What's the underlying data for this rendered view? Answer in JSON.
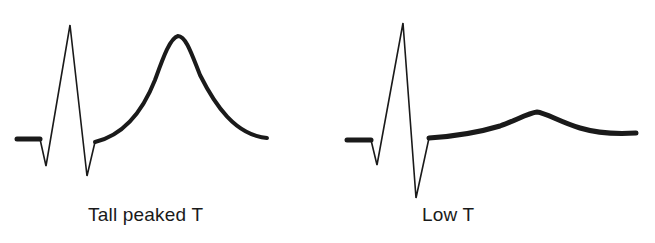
{
  "panels": [
    {
      "id": "tall-peaked-t",
      "label": "Tall peaked T",
      "description": "ECG complex with tall, peaked T wave"
    },
    {
      "id": "low-t",
      "label": "Low T",
      "description": "ECG complex with low, flattened T wave"
    }
  ],
  "colors": {
    "trace": "#1a1a1a",
    "background": "#ffffff"
  }
}
